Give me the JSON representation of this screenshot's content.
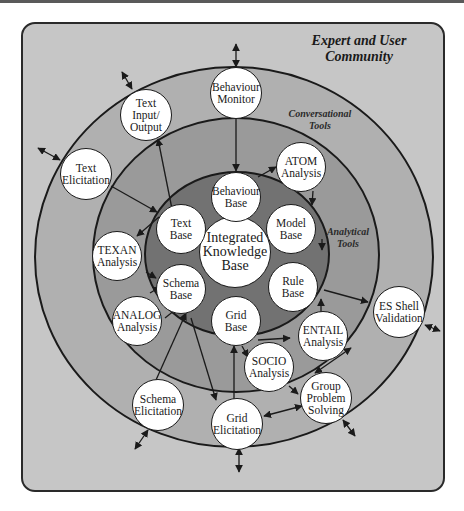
{
  "title": "Expert and User\nCommunity",
  "bands": {
    "conversational": "Conversational\nTools",
    "analytical": "Analytical\nTools"
  },
  "colors": {
    "page_background": "#ffffff",
    "community_background": "#c6c6c6",
    "conversational_band": "#b0b0b0",
    "analytical_band": "#9a9a9a",
    "knowledge_core": "#727272",
    "node_fill": "#ffffff",
    "line": "#1a1a1a"
  },
  "nodes": {
    "integrated_knowledge_base": "Integrated\nKnowledge\nBase",
    "behaviour_base": "Behaviour\nBase",
    "model_base": "Model\nBase",
    "rule_base": "Rule\nBase",
    "grid_base": "Grid\nBase",
    "schema_base": "Schema\nBase",
    "text_base": "Text\nBase",
    "atom_analysis": "ATOM\nAnalysis",
    "texan_analysis": "TEXAN\nAnalysis",
    "analog_analysis": "ANALOG\nAnalysis",
    "entail_analysis": "ENTAIL\nAnalysis",
    "socio_analysis": "SOCIO\nAnalysis",
    "behaviour_monitor": "Behaviour\nMonitor",
    "text_input_output": "Text\nInput/\nOutput",
    "text_elicitation": "Text\nElicitation",
    "schema_elicitation": "Schema\nElicitation",
    "grid_elicitation": "Grid\nElicitation",
    "group_problem_solving": "Group\nProblem\nSolving",
    "es_shell_validation": "ES Shell\nValidation"
  }
}
